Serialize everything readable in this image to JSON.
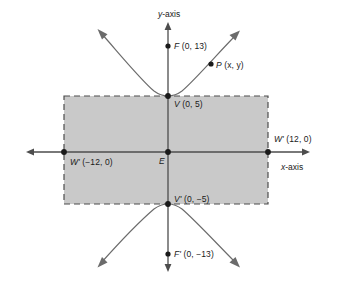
{
  "figure": {
    "background_color": "#ffffff",
    "axis_color": "#4d4d4d",
    "curve_color": "#6b6b6b",
    "rect_fill": "#c9c9c9",
    "rect_stroke": "#4d4d4d",
    "point_color": "#1a1a1a",
    "text_color": "#1a1a1a"
  },
  "axes": {
    "y_axis_label": "y-axis",
    "x_axis_label": "x-axis"
  },
  "points": [
    {
      "id": "F",
      "name_text": "F",
      "prime": "",
      "coords_text": "(0, 13)",
      "x": 0,
      "y": 13
    },
    {
      "id": "P",
      "name_text": "P",
      "prime": "",
      "coords_text": "(x, y)",
      "x": null,
      "y": null
    },
    {
      "id": "V",
      "name_text": "V",
      "prime": "",
      "coords_text": "(0, 5)",
      "x": 0,
      "y": 5
    },
    {
      "id": "W-right",
      "name_text": "W",
      "prime": "'",
      "coords_text": "(12, 0)",
      "x": 12,
      "y": 0
    },
    {
      "id": "E",
      "name_text": "E",
      "prime": "",
      "coords_text": "",
      "x": 0,
      "y": 0
    },
    {
      "id": "W-left",
      "name_text": "W",
      "prime": "'",
      "coords_text": "(−12, 0)",
      "x": -12,
      "y": 0
    },
    {
      "id": "V-prime",
      "name_text": "V",
      "prime": "'",
      "coords_text": "(0, −5)",
      "x": 0,
      "y": -5
    },
    {
      "id": "F-prime",
      "name_text": "F",
      "prime": "'",
      "coords_text": "(0, −13)",
      "x": 0,
      "y": -13
    }
  ],
  "labels": {
    "y_axis": "y-axis",
    "x_axis": "x-axis",
    "F": "F (0, 13)",
    "P": "P (x, y)",
    "V": "V (0, 5)",
    "W_right": "W' (12, 0)",
    "E": "E",
    "W_left": "W' (−12, 0)",
    "V_prime": "V' (0, −5)",
    "F_prime": "F' (0, −13)"
  },
  "chart_data": {
    "type": "line",
    "xlabel": "x-axis",
    "ylabel": "y-axis",
    "grid": false,
    "legend": "none",
    "xlim": [
      -17,
      17
    ],
    "ylim": [
      -16,
      16
    ],
    "annotations": [
      {
        "text": "F (0, 13)",
        "x": 0,
        "y": 13
      },
      {
        "text": "P (x, y)",
        "x": 9,
        "y": 7.7
      },
      {
        "text": "V (0, 5)",
        "x": 0,
        "y": 5
      },
      {
        "text": "W' (12, 0)",
        "x": 12,
        "y": 0
      },
      {
        "text": "E",
        "x": 0,
        "y": 0
      },
      {
        "text": "W' (−12, 0)",
        "x": -12,
        "y": 0
      },
      {
        "text": "V' (0, −5)",
        "x": 0,
        "y": -5
      },
      {
        "text": "F' (0, −13)",
        "x": 0,
        "y": -13
      }
    ],
    "series": [
      {
        "name": "upper branch",
        "x": [
          -13,
          -10,
          -7,
          -4,
          0,
          4,
          7,
          10,
          13
        ],
        "values": [
          8.3,
          7.0,
          6.1,
          5.4,
          5.0,
          5.4,
          6.1,
          7.0,
          8.3
        ]
      },
      {
        "name": "lower branch",
        "x": [
          -13,
          -10,
          -7,
          -4,
          0,
          4,
          7,
          10,
          13
        ],
        "values": [
          -8.3,
          -7.0,
          -6.1,
          -5.4,
          -5.0,
          -5.4,
          -6.1,
          -7.0,
          -8.3
        ]
      }
    ],
    "rectangle": {
      "x_min": -12,
      "x_max": 12,
      "y_min": -5,
      "y_max": 5,
      "style": "dashed",
      "fill": "#c9c9c9"
    }
  }
}
